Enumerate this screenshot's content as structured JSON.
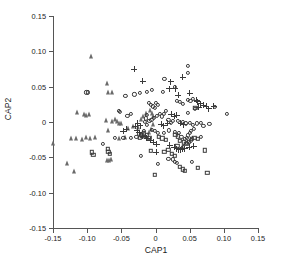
{
  "chart_data": {
    "type": "scatter",
    "title": "",
    "xlabel": "CAP1",
    "ylabel": "CAP2",
    "xlim": [
      -0.15,
      0.15
    ],
    "ylim": [
      -0.15,
      0.15
    ],
    "xticks": [
      -0.15,
      -0.1,
      -0.05,
      0,
      0.05,
      0.1,
      0.15
    ],
    "xticklabels": [
      "-0.15",
      "-0.10",
      "-0.05",
      "0",
      "0.05",
      "0.10",
      "0.15"
    ],
    "yticks": [
      -0.15,
      -0.1,
      -0.05,
      0,
      0.05,
      0.1,
      0.15
    ],
    "yticklabels": [
      "-0.15",
      "-0.10",
      "-0.05",
      "0",
      "0.05",
      "0.10",
      "0.15"
    ],
    "grid": false,
    "legend": "none",
    "series": [
      {
        "name": "group-triangle",
        "marker": "triangle",
        "color": "#6a6a6a",
        "points": [
          [
            -0.094,
            0.094
          ],
          [
            -0.071,
            0.055
          ],
          [
            -0.069,
            0.042
          ],
          [
            -0.064,
            0.042
          ],
          [
            -0.115,
            0.014
          ],
          [
            -0.105,
            0.012
          ],
          [
            -0.101,
            0.01
          ],
          [
            -0.097,
            0.012
          ],
          [
            -0.073,
            0.003
          ],
          [
            -0.063,
            0.001
          ],
          [
            -0.059,
            0.004
          ],
          [
            -0.056,
            0.002
          ],
          [
            -0.054,
            -0.002
          ],
          [
            -0.051,
            -0.001
          ],
          [
            -0.04,
            -0.008
          ],
          [
            -0.033,
            -0.006
          ],
          [
            -0.026,
            -0.007
          ],
          [
            -0.021,
            0.004
          ],
          [
            -0.018,
            0.008
          ],
          [
            -0.014,
            0.013
          ],
          [
            -0.008,
            0.017
          ],
          [
            -0.005,
            0.013
          ],
          [
            -0.003,
            0.009
          ],
          [
            -0.004,
            -0.003
          ],
          [
            -0.007,
            -0.01
          ],
          [
            -0.01,
            -0.014
          ],
          [
            -0.123,
            -0.022
          ],
          [
            -0.116,
            -0.023
          ],
          [
            -0.107,
            -0.024
          ],
          [
            -0.101,
            -0.021
          ],
          [
            -0.096,
            -0.022
          ],
          [
            -0.088,
            -0.021
          ],
          [
            -0.07,
            -0.012
          ],
          [
            -0.053,
            -0.023
          ],
          [
            -0.044,
            -0.021
          ],
          [
            -0.15,
            -0.03
          ],
          [
            -0.129,
            -0.058
          ],
          [
            -0.119,
            -0.07
          ],
          [
            -0.071,
            -0.054
          ],
          [
            -0.068,
            -0.054
          ],
          [
            -0.065,
            -0.053
          ],
          [
            -0.02,
            -0.018
          ],
          [
            -0.016,
            -0.02
          ]
        ]
      },
      {
        "name": "group-circle",
        "marker": "circle",
        "color": "#3a3a3a",
        "points": [
          [
            0.048,
            0.079
          ],
          [
            0.047,
            0.07
          ],
          [
            0.013,
            0.061
          ],
          [
            0.028,
            0.05
          ],
          [
            0.011,
            0.043
          ],
          [
            -0.005,
            0.045
          ],
          [
            -0.013,
            0.043
          ],
          [
            -0.023,
            0.041
          ],
          [
            -0.031,
            0.039
          ],
          [
            -0.044,
            0.037
          ],
          [
            -0.101,
            0.042
          ],
          [
            -0.099,
            0.042
          ],
          [
            -0.053,
            0.016
          ],
          [
            -0.052,
            0.014
          ],
          [
            -0.01,
            0.027
          ],
          [
            -0.007,
            0.024
          ],
          [
            -0.004,
            0.022
          ],
          [
            -0.001,
            0.02
          ],
          [
            0.001,
            0.027
          ],
          [
            0.004,
            0.024
          ],
          [
            0.031,
            0.03
          ],
          [
            0.036,
            0.028
          ],
          [
            0.04,
            0.026
          ],
          [
            0.047,
            0.031
          ],
          [
            0.051,
            0.03
          ],
          [
            0.055,
            0.033
          ],
          [
            0.058,
            0.018
          ],
          [
            0.047,
            0.013
          ],
          [
            0.104,
            0.012
          ],
          [
            0.087,
            0.021
          ],
          [
            0.015,
            0.016
          ],
          [
            0.012,
            0.012
          ],
          [
            -0.012,
            0.01
          ],
          [
            -0.014,
            0.005
          ],
          [
            -0.015,
            0.0
          ],
          [
            -0.013,
            -0.004
          ],
          [
            -0.009,
            0.001
          ],
          [
            -0.006,
            0.003
          ],
          [
            -0.002,
            0.006
          ],
          [
            0.002,
            0.009
          ],
          [
            0.006,
            0.012
          ],
          [
            0.009,
            0.008
          ],
          [
            0.019,
            0.003
          ],
          [
            0.022,
            -0.001
          ],
          [
            0.026,
            0.002
          ],
          [
            0.033,
            0.001
          ],
          [
            0.04,
            0.0
          ],
          [
            0.044,
            -0.002
          ],
          [
            0.05,
            -0.001
          ],
          [
            0.055,
            -0.004
          ],
          [
            0.061,
            -0.002
          ],
          [
            0.066,
            -0.001
          ],
          [
            0.079,
            -0.003
          ],
          [
            0.07,
            -0.006
          ],
          [
            0.056,
            -0.01
          ],
          [
            0.052,
            -0.013
          ],
          [
            0.05,
            -0.016
          ],
          [
            0.048,
            -0.019
          ],
          [
            0.046,
            -0.022
          ],
          [
            0.043,
            -0.024
          ],
          [
            0.038,
            -0.021
          ],
          [
            0.034,
            -0.016
          ],
          [
            0.028,
            -0.014
          ],
          [
            0.02,
            -0.012
          ],
          [
            0.012,
            -0.015
          ],
          [
            0.004,
            -0.016
          ],
          [
            -0.001,
            -0.013
          ],
          [
            -0.005,
            -0.011
          ],
          [
            -0.017,
            -0.013
          ],
          [
            -0.024,
            -0.017
          ],
          [
            -0.028,
            -0.021
          ],
          [
            -0.036,
            -0.023
          ],
          [
            -0.047,
            -0.022
          ],
          [
            -0.06,
            -0.023
          ],
          [
            -0.077,
            -0.031
          ],
          [
            -0.021,
            -0.048
          ],
          [
            0.003,
            -0.059
          ],
          [
            0.019,
            -0.052
          ],
          [
            0.026,
            -0.053
          ],
          [
            0.028,
            -0.056
          ],
          [
            0.031,
            -0.058
          ],
          [
            0.053,
            -0.057
          ],
          [
            0.04,
            -0.035
          ],
          [
            0.046,
            -0.03
          ],
          [
            0.052,
            -0.026
          ],
          [
            0.066,
            -0.021
          ],
          [
            -0.036,
            0.012
          ],
          [
            -0.041,
            0.009
          ]
        ]
      },
      {
        "name": "group-plus",
        "marker": "plus",
        "color": "#3a3a3a",
        "points": [
          [
            -0.031,
            0.075
          ],
          [
            -0.019,
            0.058
          ],
          [
            0.022,
            0.057
          ],
          [
            0.04,
            0.063
          ],
          [
            0.02,
            0.047
          ],
          [
            0.029,
            0.047
          ],
          [
            0.033,
            0.038
          ],
          [
            0.05,
            0.041
          ],
          [
            0.06,
            0.031
          ],
          [
            0.061,
            0.029
          ],
          [
            0.066,
            0.026
          ],
          [
            0.07,
            0.024
          ],
          [
            0.074,
            0.022
          ],
          [
            0.078,
            0.019
          ],
          [
            0.063,
            0.021
          ],
          [
            0.085,
            0.022
          ],
          [
            0.023,
            0.011
          ],
          [
            0.027,
            0.008
          ],
          [
            0.031,
            0.01
          ],
          [
            0.018,
            -0.002
          ],
          [
            0.012,
            -0.005
          ],
          [
            0.008,
            -0.003
          ],
          [
            0.037,
            -0.002
          ],
          [
            0.041,
            -0.004
          ],
          [
            -0.03,
            -0.006
          ],
          [
            -0.026,
            -0.002
          ],
          [
            -0.022,
            -0.005
          ],
          [
            -0.027,
            -0.012
          ],
          [
            -0.024,
            -0.015
          ],
          [
            -0.019,
            -0.02
          ],
          [
            -0.013,
            -0.023
          ],
          [
            -0.008,
            -0.026
          ],
          [
            -0.003,
            -0.029
          ],
          [
            0.002,
            -0.031
          ],
          [
            0.021,
            -0.033
          ],
          [
            0.027,
            -0.036
          ],
          [
            0.031,
            -0.038
          ],
          [
            0.034,
            -0.039
          ],
          [
            0.037,
            -0.039
          ],
          [
            0.04,
            -0.038
          ],
          [
            0.043,
            -0.038
          ],
          [
            0.001,
            -0.043
          ],
          [
            0.049,
            -0.036
          ],
          [
            0.056,
            -0.034
          ],
          [
            -0.047,
            -0.013
          ],
          [
            -0.043,
            -0.01
          ]
        ]
      },
      {
        "name": "group-square",
        "marker": "square",
        "color": "#3a3a3a",
        "points": [
          [
            0.058,
            0.02
          ],
          [
            -0.017,
            -0.016
          ],
          [
            -0.02,
            -0.019
          ],
          [
            -0.023,
            -0.022
          ],
          [
            -0.013,
            -0.019
          ],
          [
            -0.009,
            -0.022
          ],
          [
            0.005,
            -0.021
          ],
          [
            0.01,
            -0.023
          ],
          [
            0.015,
            -0.025
          ],
          [
            0.036,
            -0.027
          ],
          [
            0.041,
            -0.029
          ],
          [
            0.045,
            -0.031
          ],
          [
            0.049,
            -0.028
          ],
          [
            0.053,
            -0.024
          ],
          [
            0.057,
            -0.022
          ],
          [
            0.062,
            -0.024
          ],
          [
            0.072,
            -0.04
          ],
          [
            0.032,
            -0.034
          ],
          [
            -0.07,
            -0.038
          ],
          [
            -0.069,
            -0.042
          ],
          [
            -0.067,
            -0.045
          ],
          [
            -0.001,
            -0.075
          ],
          [
            0.036,
            -0.063
          ],
          [
            0.04,
            -0.067
          ],
          [
            0.043,
            -0.069
          ],
          [
            0.062,
            -0.065
          ],
          [
            0.076,
            -0.072
          ],
          [
            0.013,
            -0.042
          ],
          [
            -0.007,
            -0.041
          ],
          [
            0.024,
            -0.045
          ],
          [
            0.028,
            -0.048
          ],
          [
            0.019,
            -0.039
          ],
          [
            -0.093,
            -0.043
          ],
          [
            -0.091,
            -0.046
          ],
          [
            0.029,
            -0.018
          ],
          [
            0.033,
            -0.02
          ]
        ]
      }
    ]
  }
}
